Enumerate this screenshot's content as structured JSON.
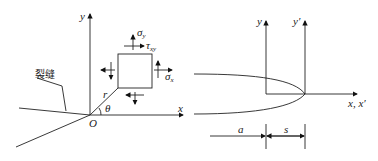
{
  "left_diagram": {
    "axis_x": "x",
    "axis_y": "y",
    "origin": "O",
    "radius": "r",
    "angle": "θ",
    "crack_label": "裂缝",
    "sigma_y": "σ",
    "sigma_y_sub": "y",
    "tau_xy": "τ",
    "tau_xy_sub": "xy",
    "sigma_x": "σ",
    "sigma_x_sub": "x"
  },
  "right_diagram": {
    "axis_y": "y",
    "axis_y_prime": "y′",
    "axis_x": "x, x′",
    "dim_a": "a",
    "dim_s": "s"
  }
}
